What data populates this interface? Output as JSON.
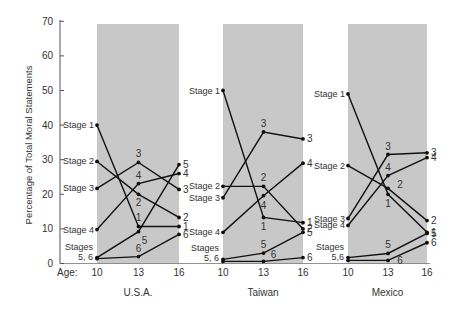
{
  "chart_data": {
    "type": "line",
    "title": "",
    "ylabel": "Percentage of Total Moral Statements",
    "xlabel": "Age:",
    "ylim": [
      0,
      70
    ],
    "yticks": [
      0,
      10,
      20,
      30,
      40,
      50,
      60,
      70
    ],
    "x": [
      10,
      13,
      16
    ],
    "grid": false,
    "panels": [
      {
        "country": "U.S.A.",
        "series": [
          {
            "name": "Stage 1",
            "values": [
              40,
              10.7,
              10.7
            ]
          },
          {
            "name": "Stage 2",
            "values": [
              29.5,
              20,
              13.3
            ]
          },
          {
            "name": "Stage 3",
            "values": [
              21.7,
              29.2,
              21.4
            ]
          },
          {
            "name": "Stage 4",
            "values": [
              9.8,
              23.1,
              26
            ]
          },
          {
            "name": "Stage 5",
            "values": [
              1.7,
              9.2,
              28.6
            ]
          },
          {
            "name": "Stage 6",
            "values": [
              1.4,
              2,
              8.4
            ]
          }
        ]
      },
      {
        "country": "Taiwan",
        "series": [
          {
            "name": "Stage 1",
            "values": [
              50,
              13.3,
              11.8
            ]
          },
          {
            "name": "Stage 2",
            "values": [
              22.3,
              22.3,
              10
            ]
          },
          {
            "name": "Stage 3",
            "values": [
              19,
              38,
              36
            ]
          },
          {
            "name": "Stage 4",
            "values": [
              9,
              19.6,
              29
            ]
          },
          {
            "name": "Stage 5",
            "values": [
              1.2,
              3,
              9
            ]
          },
          {
            "name": "Stage 6",
            "values": [
              0.6,
              0.6,
              1.7
            ]
          }
        ]
      },
      {
        "country": "Mexico",
        "series": [
          {
            "name": "Stage 1",
            "values": [
              49,
              20,
              9
            ]
          },
          {
            "name": "Stage 2",
            "values": [
              28.3,
              21.7,
              12.4
            ]
          },
          {
            "name": "Stage 3",
            "values": [
              13,
              31.5,
              32
            ]
          },
          {
            "name": "Stage 4",
            "values": [
              11,
              25.4,
              30.6
            ]
          },
          {
            "name": "Stage 5",
            "values": [
              1.7,
              2.9,
              8.7
            ]
          },
          {
            "name": "Stage 6",
            "values": [
              0.9,
              0.9,
              6
            ]
          }
        ]
      }
    ]
  },
  "layout_labels": {
    "left_labels": {
      "U.S.A.": [
        {
          "text": "Stage 1",
          "stage": 1
        },
        {
          "text": "Stage 2",
          "stage": 2
        },
        {
          "text": "Stage 3",
          "stage": 3
        },
        {
          "text": "Stage 4",
          "stage": 4
        },
        {
          "text": "Stages",
          "sub": "5, 6",
          "stage": 56
        }
      ],
      "Taiwan": [
        {
          "text": "Stage 1",
          "stage": 1
        },
        {
          "text": "Stage 2",
          "stage": 2
        },
        {
          "text": "Stage 3",
          "stage": 3
        },
        {
          "text": "Stage 4",
          "stage": 4
        },
        {
          "text": "Stages",
          "sub": "5, 6",
          "stage": 56
        }
      ],
      "Mexico": [
        {
          "text": "Stage 1",
          "stage": 1
        },
        {
          "text": "Stage 2",
          "stage": 2
        },
        {
          "text": "Stage 3",
          "stage": 3
        },
        {
          "text": "Stage 4",
          "stage": 4
        },
        {
          "text": "Stages",
          "sub": "5,6",
          "stage": 56
        }
      ]
    }
  },
  "colors": {
    "panel_bg": "#c8c8c8",
    "line": "#111111",
    "text": "#333333"
  }
}
